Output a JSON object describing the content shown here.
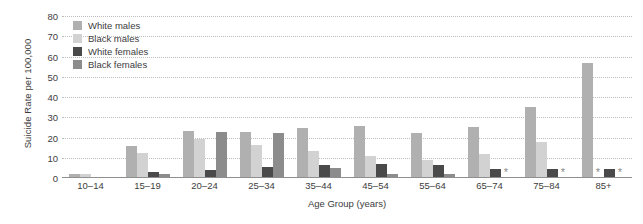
{
  "chart_data": {
    "type": "bar",
    "title": "",
    "xlabel": "Age Group (years)",
    "ylabel": "Suicide Rate per 100,000",
    "ylim": [
      0,
      80
    ],
    "yticks": [
      0,
      10,
      20,
      30,
      40,
      50,
      60,
      70,
      80
    ],
    "grid": true,
    "legend_position": "top-left",
    "suppressed_marker": "*",
    "categories": [
      "10–14",
      "15–19",
      "20–24",
      "25–34",
      "35–44",
      "45–54",
      "55–64",
      "65–74",
      "75–84",
      "85+"
    ],
    "series": [
      {
        "name": "White males",
        "color": "#b0b0b0",
        "values": [
          2.0,
          16.0,
          23.0,
          22.5,
          24.5,
          25.5,
          22.0,
          25.0,
          35.0,
          57.0
        ]
      },
      {
        "name": "Black males",
        "color": "#d2d2d2",
        "values": [
          1.8,
          12.5,
          19.5,
          16.5,
          13.5,
          11.0,
          9.0,
          12.0,
          18.0,
          0.0
        ]
      },
      {
        "name": "White females",
        "color": "#4a4a4a",
        "values": [
          0.6,
          3.2,
          4.0,
          5.5,
          6.5,
          7.0,
          6.5,
          4.5,
          4.5,
          4.5
        ]
      },
      {
        "name": "Black females",
        "color": "#8c8c8c",
        "values": [
          0.4,
          1.8,
          22.5,
          22.0,
          5.0,
          2.0,
          2.0,
          0.0,
          0.0,
          0.0
        ]
      }
    ],
    "suppressed": [
      {
        "category": "85+",
        "series": "Black males"
      },
      {
        "category": "65–74",
        "series": "Black females"
      },
      {
        "category": "75–84",
        "series": "Black females"
      },
      {
        "category": "85+",
        "series": "Black females"
      }
    ]
  },
  "legend": {
    "items": [
      {
        "label": "White males",
        "color": "#b0b0b0"
      },
      {
        "label": "Black males",
        "color": "#d2d2d2"
      },
      {
        "label": "White females",
        "color": "#4a4a4a"
      },
      {
        "label": "Black females",
        "color": "#8c8c8c"
      }
    ]
  },
  "axes": {
    "y_title": "Suicide Rate per 100,000",
    "x_title": "Age Group (years)",
    "y_tick_labels": [
      "0",
      "10",
      "20",
      "30",
      "40",
      "50",
      "60",
      "70",
      "80"
    ],
    "x_tick_labels": [
      "10–14",
      "15–19",
      "20–24",
      "25–34",
      "35–44",
      "45–54",
      "55–64",
      "65–74",
      "75–84",
      "85+"
    ]
  },
  "colors": {
    "gridline": "#bdbdbd",
    "axis": "#8f8f8f",
    "text": "#3d3d3d",
    "background": "#ffffff",
    "suppressed_star": "#8a8a8a"
  }
}
